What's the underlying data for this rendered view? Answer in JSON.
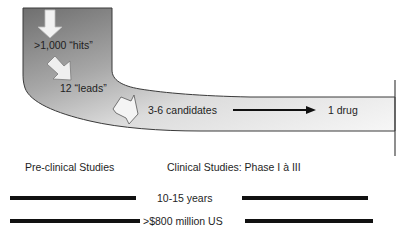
{
  "funnel": {
    "stages": [
      {
        "label": ">1,000 “hits”",
        "arrow": "down-arrow"
      },
      {
        "label": "12 “leads”",
        "arrow": "down-right-arrow"
      },
      {
        "label": "3-6 candidates",
        "arrow": "right-arrow"
      },
      {
        "label": "1 drug",
        "arrow": "long-right-arrow"
      }
    ],
    "colors": {
      "gradient_dark": "#7a7a7a",
      "gradient_light": "#f4f4f4",
      "outline": "#3a3a3a",
      "arrow_fill": "#f2f2f2"
    }
  },
  "phases": {
    "preclinical": "Pre-clinical Studies",
    "clinical": "Clinical Studies: Phase I à III"
  },
  "metrics": {
    "duration": "10-15 years",
    "cost": ">$800 million US"
  }
}
